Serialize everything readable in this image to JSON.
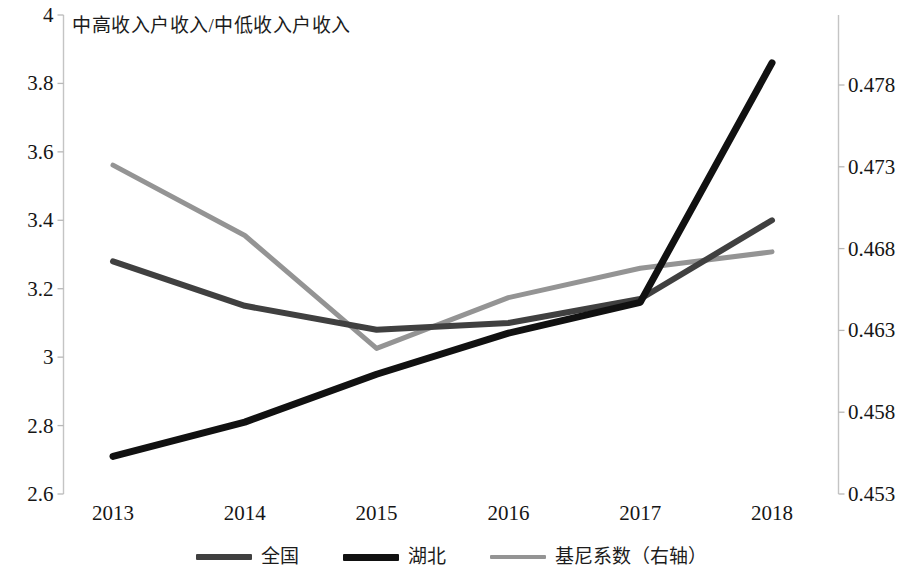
{
  "chart_data": {
    "type": "line",
    "title": "中高收入户收入/中低收入户收入",
    "xlabel": "",
    "ylabel": "",
    "y2label": "",
    "grid": false,
    "legend_position": "bottom-center",
    "categories": [
      "2013",
      "2014",
      "2015",
      "2016",
      "2017",
      "2018"
    ],
    "x_tick_labels": [
      "2013",
      "2014",
      "2015",
      "2016",
      "2017",
      "2018"
    ],
    "ylim": [
      2.6,
      4
    ],
    "y_tick_labels": [
      "4",
      "3.8",
      "3.6",
      "3.4",
      "3.2",
      "3",
      "2.8",
      "2.6"
    ],
    "y_ticks": [
      4,
      3.8,
      3.6,
      3.4,
      3.2,
      3,
      2.8,
      2.6
    ],
    "y2lim": [
      0.453,
      0.48
    ],
    "y2_tick_labels": [
      "0.478",
      "0.473",
      "0.468",
      "0.463",
      "0.458",
      "0.453"
    ],
    "y2_ticks": [
      0.478,
      0.473,
      0.468,
      0.463,
      0.458,
      0.453
    ],
    "series": [
      {
        "name": "全国",
        "axis": "left",
        "color": "#404040",
        "width": 6,
        "values": [
          3.28,
          3.15,
          3.08,
          3.1,
          3.17,
          3.4
        ]
      },
      {
        "name": "湖北",
        "axis": "left",
        "color": "#111111",
        "width": 7,
        "values": [
          2.71,
          2.81,
          2.95,
          3.07,
          3.16,
          3.86
        ]
      },
      {
        "name": "基尼系数（右轴）",
        "axis": "right",
        "color": "#949494",
        "width": 5,
        "values": [
          0.4731,
          0.4688,
          0.4619,
          0.465,
          0.4668,
          0.4678
        ]
      }
    ]
  },
  "legend": {
    "items": [
      {
        "label": "全国",
        "color": "#404040"
      },
      {
        "label": "湖北",
        "color": "#111111"
      },
      {
        "label": "基尼系数（右轴）",
        "color": "#949494"
      }
    ]
  },
  "axis_colors": {
    "axis_line": "#bfbfbf",
    "tick": "#b0b0b0",
    "text": "#161616"
  }
}
